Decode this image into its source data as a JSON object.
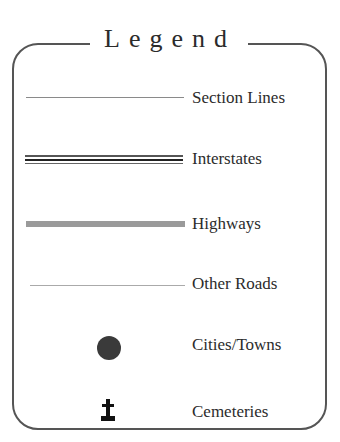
{
  "legend": {
    "title": "Legend",
    "items": [
      {
        "label": "Section Lines",
        "symbol": "thin-gray-line",
        "color": "#8a8a8a"
      },
      {
        "label": "Interstates",
        "symbol": "triple-line",
        "color": "#333333"
      },
      {
        "label": "Highways",
        "symbol": "thick-gray-bar",
        "color": "#9a9a9a"
      },
      {
        "label": "Other Roads",
        "symbol": "hairline",
        "color": "#999999"
      },
      {
        "label": "Cities/Towns",
        "symbol": "filled-circle",
        "color": "#3a3a3a"
      },
      {
        "label": "Cemeteries",
        "symbol": "cross-on-base",
        "color": "#111111"
      }
    ]
  }
}
